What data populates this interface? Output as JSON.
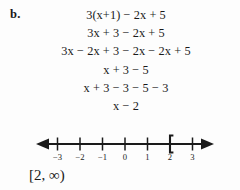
{
  "problem": {
    "label": "b.",
    "work_lines": [
      "3(x+1) − 2x + 5",
      "3x + 3 − 2x + 5",
      "3x − 2x + 3 − 2x − 2x + 5",
      "x + 3 − 5",
      "x + 3 − 3 − 5 − 3",
      "x − 2"
    ],
    "answer": "[2, ∞)"
  },
  "chart_data": {
    "type": "number-line",
    "title": "",
    "xlabel": "",
    "ylabel": "",
    "axis_range": [
      -4,
      4
    ],
    "visible_span": [
      -3.6,
      3.6
    ],
    "ticks": [
      -3,
      -2,
      -1,
      0,
      1,
      2,
      3
    ],
    "tick_labels": [
      "−3",
      "−2",
      "−1",
      "0",
      "1",
      "2",
      "3"
    ],
    "arrow_left": true,
    "arrow_right": true,
    "grid": false,
    "legend": "none",
    "interval": {
      "notation": "[2, ∞)",
      "lower_bound": 2,
      "lower_inclusive": true,
      "upper_bound": "∞",
      "upper_inclusive": false,
      "bracket_glyph": "[",
      "bracket_at": 2,
      "shaded_from": 2,
      "shaded_to": 3.6
    },
    "colors": {
      "line": "#1a1a1a",
      "tick": "#1a1a1a",
      "bracket": "#1a1a1a",
      "text": "#1a1a1a",
      "background": "#fdfdfd"
    }
  }
}
